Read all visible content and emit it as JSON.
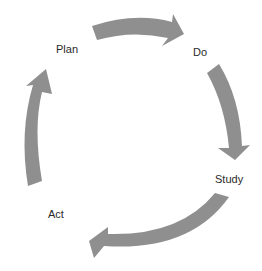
{
  "diagram": {
    "type": "cycle",
    "arrow_color": "#8f8f8f",
    "stages": [
      {
        "label": "Plan"
      },
      {
        "label": "Do"
      },
      {
        "label": "Study"
      },
      {
        "label": "Act"
      }
    ]
  }
}
